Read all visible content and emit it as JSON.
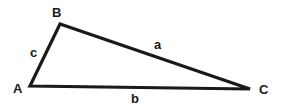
{
  "diagram": {
    "type": "triangle",
    "stroke_color": "#1a1a1a",
    "vertices": {
      "A": {
        "label": "A",
        "x": 30,
        "y": 86
      },
      "B": {
        "label": "B",
        "x": 60,
        "y": 24
      },
      "C": {
        "label": "C",
        "x": 250,
        "y": 89
      }
    },
    "sides": {
      "a": {
        "label": "a",
        "from": "B",
        "to": "C"
      },
      "b": {
        "label": "b",
        "from": "A",
        "to": "C"
      },
      "c": {
        "label": "c",
        "from": "A",
        "to": "B"
      }
    }
  }
}
